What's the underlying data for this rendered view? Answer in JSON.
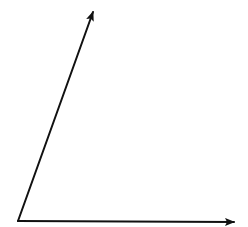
{
  "diagram": {
    "type": "angle",
    "colors": {
      "background": "#ffffff",
      "stroke": "#111111"
    },
    "vertex": {
      "x": 18,
      "y": 221
    },
    "rays": [
      {
        "name": "inclined-ray",
        "from": {
          "x": 18,
          "y": 221
        },
        "to": {
          "x": 93,
          "y": 12
        }
      },
      {
        "name": "horizontal-ray",
        "from": {
          "x": 18,
          "y": 221
        },
        "to": {
          "x": 234,
          "y": 222
        }
      }
    ],
    "labels": []
  }
}
